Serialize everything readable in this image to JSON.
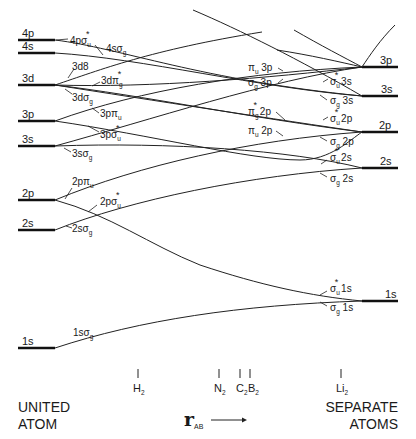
{
  "diagram": {
    "type": "correlation-diagram",
    "left_title": [
      "UNITED",
      "ATOM"
    ],
    "right_title": [
      "SEPARATE",
      "ATOMS"
    ],
    "axis": {
      "symbol": "r",
      "subscript": "AB",
      "arrow": "→"
    },
    "united_atom_levels": [
      {
        "label": "4p",
        "y": 40
      },
      {
        "label": "4s",
        "y": 53
      },
      {
        "label": "3d",
        "y": 85
      },
      {
        "label": "3p",
        "y": 121
      },
      {
        "label": "3s",
        "y": 146
      },
      {
        "label": "2p",
        "y": 200
      },
      {
        "label": "2s",
        "y": 230
      },
      {
        "label": "1s",
        "y": 348
      }
    ],
    "separate_atom_levels": [
      {
        "label": "3p",
        "y": 67
      },
      {
        "label": "3s",
        "y": 96
      },
      {
        "label": "2p",
        "y": 132
      },
      {
        "label": "2s",
        "y": 168
      },
      {
        "label": "1s",
        "y": 301
      }
    ],
    "united_atom_orbitals": [
      {
        "prefix": "4p",
        "greek": "σ",
        "sub": "u",
        "star": true
      },
      {
        "prefix": "4s",
        "greek": "σ",
        "sub": "g",
        "star": false
      },
      {
        "prefix": "3d",
        "greek": "δ",
        "sub": "",
        "star": false,
        "text": "3d8"
      },
      {
        "prefix": "3d",
        "greek": "π",
        "sub": "g",
        "star": true
      },
      {
        "prefix": "3d",
        "greek": "σ",
        "sub": "g",
        "star": false
      },
      {
        "prefix": "3p",
        "greek": "π",
        "sub": "u",
        "star": false
      },
      {
        "prefix": "3p",
        "greek": "σ",
        "sub": "u",
        "star": true
      },
      {
        "prefix": "3s",
        "greek": "σ",
        "sub": "g",
        "star": false
      },
      {
        "prefix": "2p",
        "greek": "π",
        "sub": "u",
        "star": false
      },
      {
        "prefix": "2p",
        "greek": "σ",
        "sub": "u",
        "star": true
      },
      {
        "prefix": "2s",
        "greek": "σ",
        "sub": "g",
        "star": false
      },
      {
        "prefix": "1s",
        "greek": "σ",
        "sub": "g",
        "star": false
      }
    ],
    "separate_atom_orbitals": [
      {
        "greek": "π",
        "sub": "u",
        "star": false,
        "suffix": "3p"
      },
      {
        "greek": "σ",
        "sub": "g",
        "star": false,
        "suffix": "3p"
      },
      {
        "greek": "σ",
        "sub": "u",
        "star": true,
        "suffix": "3s"
      },
      {
        "greek": "σ",
        "sub": "g",
        "star": false,
        "suffix": "3s"
      },
      {
        "greek": "π",
        "sub": "g",
        "star": true,
        "suffix": "2p"
      },
      {
        "greek": "σ",
        "sub": "u",
        "star": true,
        "suffix": "2p"
      },
      {
        "greek": "π",
        "sub": "u",
        "star": false,
        "suffix": "2p"
      },
      {
        "greek": "σ",
        "sub": "g",
        "star": false,
        "suffix": "2p"
      },
      {
        "greek": "σ",
        "sub": "u",
        "star": true,
        "suffix": "2s"
      },
      {
        "greek": "σ",
        "sub": "g",
        "star": false,
        "suffix": "2s"
      },
      {
        "greek": "σ",
        "sub": "u",
        "star": true,
        "suffix": "1s"
      },
      {
        "greek": "σ",
        "sub": "g",
        "star": false,
        "suffix": "1s"
      }
    ],
    "molecules": [
      {
        "label": "H",
        "sub": "2",
        "x": 138
      },
      {
        "label": "N",
        "sub": "2",
        "x": 219
      },
      {
        "label": "C",
        "sub": "2",
        "x": 240
      },
      {
        "label": "B",
        "sub": "2",
        "x": 250
      },
      {
        "label": "Li",
        "sub": "2",
        "x": 341
      }
    ]
  },
  "labels": {
    "left": {
      "l4p": "4p",
      "l4s": "4s",
      "l3d": "3d",
      "l3p": "3p",
      "l3s": "3s",
      "l2p": "2p",
      "l2s": "2s",
      "l1s": "1s"
    },
    "right": {
      "r3p": "3p",
      "r3s": "3s",
      "r2p": "2p",
      "r2s": "2s",
      "r1s": "1s"
    },
    "ua": {
      "o4psu": "4pσ",
      "o4sg": "4sσ",
      "o3dd": "3dδ",
      "o3dpg": "3dπ",
      "o3dsg": "3dσ",
      "o3ppu": "3pπ",
      "o3psu": "3pσ",
      "o3ssg": "3sσ",
      "o2ppu": "2pπ",
      "o2psu": "2pσ",
      "o2ssg": "2sσ",
      "o1ssg": "1sσ"
    },
    "sa": {
      "pu3p": "π",
      "sg3p": "σ",
      "su3s": "σ",
      "sg3s": "σ",
      "pg2p": "π",
      "su2p": "σ",
      "pu2p": "π",
      "sg2p": "σ",
      "su2s": "σ",
      "sg2s": "σ",
      "su1s": "σ",
      "sg1s": "σ"
    },
    "suffix": {
      "s3p": " 3p",
      "s3s": " 3s",
      "s2p": " 2p",
      "s2s": " 2s",
      "s1s": " 1s"
    },
    "subs": {
      "u": "u",
      "g": "g",
      "two": "2",
      "ab": "AB"
    },
    "star": "*",
    "mol": {
      "H": "H",
      "N": "N",
      "C": "C",
      "B": "B",
      "Li": "Li"
    },
    "titles": {
      "united1": "UNITED",
      "united2": "ATOM",
      "sep1": "SEPARATE",
      "sep2": "ATOMS",
      "r": "r",
      "arrow": "⟶"
    }
  }
}
